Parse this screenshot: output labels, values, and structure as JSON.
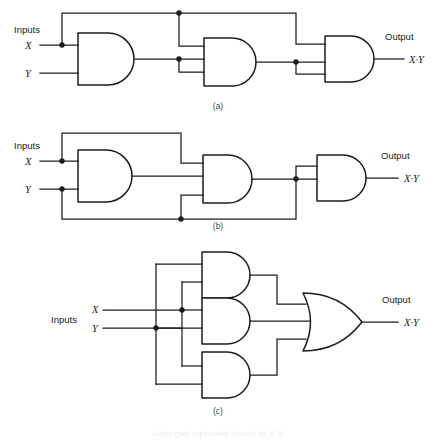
{
  "figure": {
    "title": "Logic gate equivalent circuits for X·Y",
    "panels": [
      {
        "id": "a",
        "tag": "(a)",
        "inputs_label": "Inputs",
        "input_x": "X",
        "input_y": "Y",
        "output_label": "Output",
        "output_expr": "X·Y",
        "gate_count": 3,
        "gate_types": [
          "AND",
          "AND",
          "AND"
        ],
        "description": "Three cascaded AND gates with feedback routing over the top"
      },
      {
        "id": "b",
        "tag": "(b)",
        "inputs_label": "Inputs",
        "input_x": "X",
        "input_y": "Y",
        "output_label": "Output",
        "output_expr": "X·Y",
        "gate_count": 3,
        "gate_types": [
          "AND",
          "AND",
          "AND"
        ],
        "description": "Three cascaded AND gates with X routed over the top and Y routed under the bottom"
      },
      {
        "id": "c",
        "tag": "(c)",
        "inputs_label": "Inputs",
        "input_x": "X",
        "input_y": "Y",
        "output_label": "Output",
        "output_expr": "X·Y",
        "gate_count": 4,
        "gate_types": [
          "AND",
          "AND",
          "AND",
          "OR"
        ],
        "description": "Three parallel AND gates feeding a single OR gate"
      }
    ],
    "colors": {
      "line": "#1c1c1c",
      "background": "#ffffff",
      "text": "#1a1a1a",
      "tag_text": "#4a4a4a"
    }
  }
}
